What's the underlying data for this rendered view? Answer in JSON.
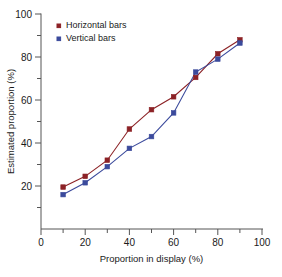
{
  "chart_data": {
    "type": "line",
    "title": "",
    "xlabel": "Proportion in display (%)",
    "ylabel": "Estimated proportion (%)",
    "xlim": [
      0,
      100
    ],
    "ylim": [
      0,
      100
    ],
    "x": [
      10,
      20,
      30,
      40,
      50,
      60,
      70,
      80,
      90
    ],
    "xticks": [
      0,
      20,
      40,
      60,
      80,
      100
    ],
    "xtick_labels": [
      "0",
      "20",
      "40",
      "60",
      "80",
      "100"
    ],
    "xminor_ticks": [
      10,
      30,
      50,
      70,
      90
    ],
    "yticks": [
      20,
      40,
      60,
      80,
      100
    ],
    "ytick_labels": [
      "20",
      "40",
      "60",
      "80",
      "100"
    ],
    "yminor_ticks": [
      10,
      30,
      50,
      70,
      90
    ],
    "grid": false,
    "legend_position": "top-left",
    "series": [
      {
        "name": "Horizontal bars",
        "color": "#8c2226",
        "marker": "square",
        "values": [
          19.5,
          24.5,
          32,
          46.5,
          55.5,
          61.5,
          70.5,
          81.5,
          88
        ]
      },
      {
        "name": "Vertical bars",
        "color": "#3b4a9c",
        "marker": "square",
        "values": [
          16,
          21.5,
          29,
          37.5,
          43,
          54,
          73,
          79,
          86.5
        ]
      }
    ]
  },
  "legend": {
    "items": [
      {
        "label": "Horizontal bars",
        "color": "#8c2226"
      },
      {
        "label": "Vertical bars",
        "color": "#3b4a9c"
      }
    ]
  },
  "axes": {
    "x_title": "Proportion in display (%)",
    "y_title": "Estimated proportion (%)"
  }
}
